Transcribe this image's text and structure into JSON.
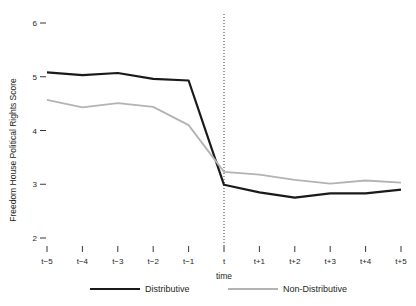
{
  "chart_data": {
    "type": "line",
    "title": "",
    "xlabel": "time",
    "ylabel": "Freedom House Political Rights Score",
    "x": [
      "t−5",
      "t−4",
      "t−3",
      "t−2",
      "t−1",
      "t",
      "t+1",
      "t+2",
      "t+3",
      "t+4",
      "t+5"
    ],
    "categories": [
      "t−5",
      "t−4",
      "t−3",
      "t−2",
      "t−1",
      "t",
      "t+1",
      "t+2",
      "t+3",
      "t+4",
      "t+5"
    ],
    "ylim": [
      2,
      6
    ],
    "yticks": [
      2,
      3,
      4,
      5,
      6
    ],
    "ytick_labels": [
      "2",
      "3",
      "4",
      "5",
      "6"
    ],
    "grid": false,
    "legend_position": "bottom",
    "series": [
      {
        "name": "Distributive",
        "color": "#1a1a1a",
        "width": 2.2,
        "values": [
          5.08,
          5.03,
          5.07,
          4.96,
          4.93,
          2.99,
          2.85,
          2.75,
          2.83,
          2.83,
          2.9
        ]
      },
      {
        "name": "Non-Distributive",
        "color": "#b3b3b3",
        "width": 1.8,
        "values": [
          4.57,
          4.43,
          4.51,
          4.44,
          4.1,
          3.23,
          3.18,
          3.08,
          3.01,
          3.07,
          3.03
        ]
      }
    ],
    "annotations": [
      {
        "name": "event-line",
        "type": "vline",
        "x": "t",
        "style": "dotted"
      }
    ]
  },
  "axes": {
    "y_title": "Freedom House Political Rights Score",
    "x_title": "time"
  },
  "legend": {
    "items": [
      {
        "label": "Distributive",
        "color": "#1a1a1a"
      },
      {
        "label": "Non-Distributive",
        "color": "#b3b3b3"
      }
    ]
  }
}
